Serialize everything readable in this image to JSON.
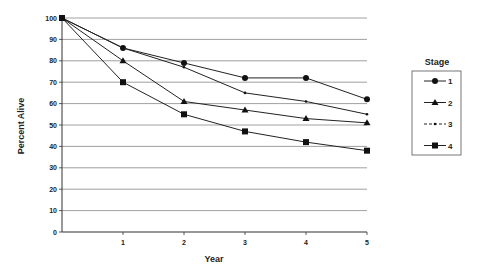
{
  "chart_data": {
    "type": "line",
    "title": "",
    "xlabel": "Year",
    "ylabel": "Percent Alive",
    "x": [
      0,
      1,
      2,
      3,
      4,
      5
    ],
    "x_tick_labels": [
      "1",
      "2",
      "3",
      "4",
      "5"
    ],
    "y_tick_labels": [
      "0",
      "10",
      "20",
      "30",
      "40",
      "50",
      "60",
      "70",
      "80",
      "90",
      "100"
    ],
    "ylim": [
      0,
      100
    ],
    "xlim": [
      0,
      5
    ],
    "grid": "horizontal",
    "legend": {
      "title": "Stage",
      "position": "right"
    },
    "series": [
      {
        "name": "1",
        "marker": "circle",
        "values": [
          100,
          86,
          79,
          72,
          72,
          62
        ]
      },
      {
        "name": "2",
        "marker": "triangle",
        "values": [
          100,
          80,
          61,
          57,
          53,
          51
        ]
      },
      {
        "name": "3",
        "marker": "dash-dot",
        "values": [
          100,
          86,
          77,
          65,
          61,
          55
        ]
      },
      {
        "name": "4",
        "marker": "square",
        "values": [
          100,
          70,
          55,
          47,
          42,
          38
        ]
      }
    ]
  },
  "labels": {
    "xlabel": "Year",
    "ylabel": "Percent Alive",
    "legend_title": "Stage"
  }
}
